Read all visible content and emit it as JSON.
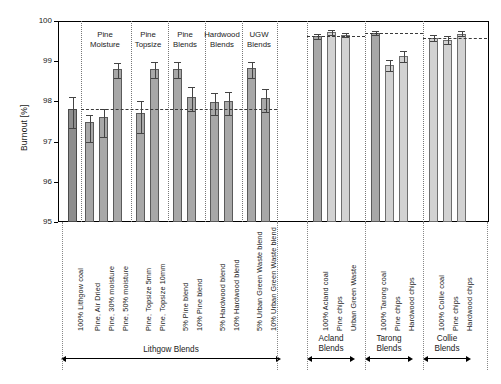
{
  "chart": {
    "type": "bar",
    "ylabel": "Burnout [%]",
    "ylim": [
      95,
      100
    ],
    "yticks": [
      "100",
      "99",
      "98",
      "97",
      "96",
      "95"
    ],
    "grid": false,
    "legend": "none"
  },
  "chart_data": {
    "type": "bar",
    "title": "",
    "xlabel": "",
    "ylabel": "Burnout [%]",
    "ylim": [
      95,
      100
    ],
    "yticks": [
      100,
      99,
      98,
      97,
      96,
      95
    ],
    "categories": [
      "100% Lithgow coal",
      "Pine, Air Dried",
      "Pine, 30% moisture",
      "Pine, 50% moisture",
      "Pine, Topsize 5mm",
      "Pine, Topsize 10mm",
      "5% Pine blend",
      "10% Pine blend",
      "5% Hardwood blend",
      "10% Hardwood blend",
      "5% Urban Green Waste blend",
      "10% Urban Green Waste blend",
      "100% Acland coal",
      "Pine chips",
      "Urban Green Waste",
      "100% Tarong coal",
      "Pine chips",
      "Hardwood chips",
      "100% Collie coal",
      "Pine chips",
      "Hardwood chips"
    ],
    "values": [
      97.82,
      97.5,
      97.6,
      98.8,
      97.7,
      98.8,
      98.8,
      98.1,
      97.99,
      98.0,
      98.82,
      98.08,
      99.62,
      99.72,
      99.65,
      99.7,
      98.9,
      99.12,
      99.58,
      99.52,
      99.68
    ],
    "errors_upper": [
      0.28,
      0.17,
      0.22,
      0.16,
      0.3,
      0.17,
      0.18,
      0.26,
      0.22,
      0.24,
      0.17,
      0.24,
      0.06,
      0.06,
      0.06,
      0.05,
      0.14,
      0.13,
      0.07,
      0.1,
      0.06
    ],
    "errors_lower": [
      0.48,
      0.5,
      0.48,
      0.22,
      0.48,
      0.22,
      0.22,
      0.34,
      0.33,
      0.33,
      0.23,
      0.34,
      0.06,
      0.06,
      0.06,
      0.05,
      0.14,
      0.13,
      0.07,
      0.1,
      0.06
    ],
    "reference_lines": [
      {
        "group": "Lithgow Blends",
        "value": 97.82
      },
      {
        "group": "Acland Blends",
        "value": 99.62
      },
      {
        "group": "Tarong Blends",
        "value": 99.7
      },
      {
        "group": "Collie Blends",
        "value": 99.58
      }
    ],
    "in_plot_group_labels": [
      "Pine Moisture",
      "Pine Topsize",
      "Pine Blends",
      "Hardwood Blends",
      "UGW Blends"
    ],
    "bottom_group_labels": [
      "Lithgow Blends",
      "Acland Blends",
      "Tarong Blends",
      "Collie Blends"
    ]
  }
}
